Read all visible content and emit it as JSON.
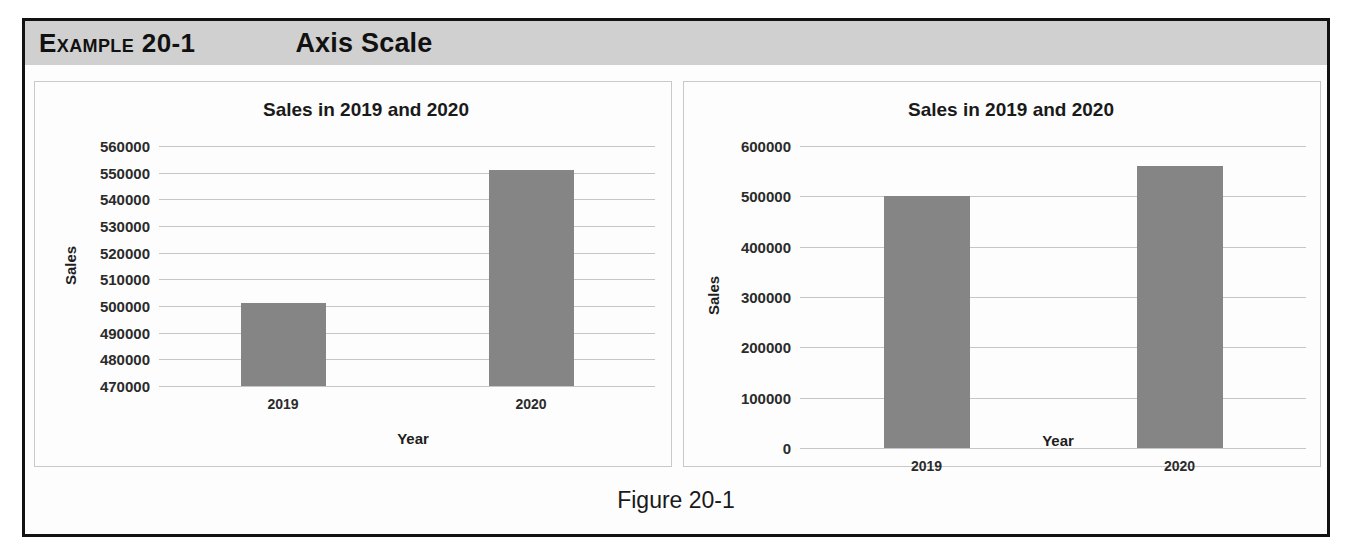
{
  "header": {
    "example_label": "Example 20-1",
    "title": "Axis Scale"
  },
  "figure_caption": "Figure 20-1",
  "ghost_text": [
    {
      "text": "a  e  a  n  o  s  r  e  c  n  e",
      "x": 150,
      "y": 398
    },
    {
      "text": "n  o  t  s  e  o  r  a  n  i  e  d  t  h  e",
      "x": 700,
      "y": 398
    },
    {
      "text": "r  a  t  i  o  n     t  h  a  t     s  a  l  e  s",
      "x": 160,
      "y": 430
    },
    {
      "text": "g  e  n  e  r  a  t  e  d     t  h  e     f  i  g  u  r  e",
      "x": 720,
      "y": 430
    },
    {
      "text": "e  s     a  n  d     t  h  e     l  o  w  e  r     b  o  u  n  d",
      "x": 700,
      "y": 470
    },
    {
      "text": "c  h  a  r  t     w  i  t  h",
      "x": 170,
      "y": 470
    },
    {
      "text": "o  n     s  c  a  l  e     v  a  l  u  e  s",
      "x": 880,
      "y": 505
    },
    {
      "text": "i  n     t  h  e     c  h  a  r  t",
      "x": 150,
      "y": 505
    }
  ],
  "charts": [
    {
      "panel": "left",
      "chart_data": {
        "type": "bar",
        "title": "Sales in 2019 and 2020",
        "xlabel": "Year",
        "ylabel": "Sales",
        "categories": [
          "2019",
          "2020"
        ],
        "values": [
          501000,
          551000
        ],
        "ylim": [
          470000,
          560000
        ],
        "yticks": [
          560000,
          550000,
          540000,
          530000,
          520000,
          510000,
          500000,
          490000,
          480000,
          470000
        ],
        "ytick_labels": [
          "560000",
          "550000",
          "540000",
          "530000",
          "520000",
          "510000",
          "500000",
          "490000",
          "480000",
          "470000"
        ],
        "grid": true,
        "legend": "none",
        "bar_color": "#858585"
      }
    },
    {
      "panel": "right",
      "chart_data": {
        "type": "bar",
        "title": "Sales in 2019 and 2020",
        "xlabel": "Year",
        "ylabel": "Sales",
        "categories": [
          "2019",
          "2020"
        ],
        "values": [
          501000,
          560000
        ],
        "ylim": [
          0,
          600000
        ],
        "yticks": [
          600000,
          500000,
          400000,
          300000,
          200000,
          100000,
          0
        ],
        "ytick_labels": [
          "600000",
          "500000",
          "400000",
          "300000",
          "200000",
          "100000",
          "0"
        ],
        "grid": true,
        "legend": "none",
        "bar_color": "#858585"
      }
    }
  ]
}
